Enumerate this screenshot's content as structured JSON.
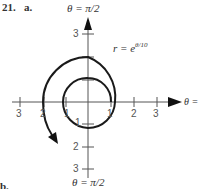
{
  "problem": {
    "number_label": "21.",
    "part_a_label": "a.",
    "part_b_label": "b."
  },
  "figure": {
    "top_axis_label": "θ = π/2",
    "right_axis_label": "θ = 0",
    "bottom_axis_label": "θ = π/2",
    "curve_label_prefix": "r = e",
    "curve_label_exponent": "θ/10",
    "x_tick_labels": {
      "neg": [
        "3",
        "2",
        "1"
      ],
      "pos": [
        "1",
        "2",
        "3"
      ]
    },
    "y_tick_labels": {
      "up": [
        "3"
      ],
      "down": [
        "1",
        "2",
        "3"
      ]
    },
    "colors": {
      "axis": "#555555",
      "curve": "#1a1a1a"
    }
  }
}
